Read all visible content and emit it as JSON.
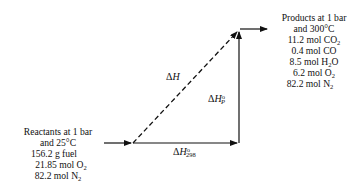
{
  "reactants": {
    "title_line1": "Reactants at 1 bar",
    "title_line2": "and 25°C",
    "fuel": "156.2 g fuel",
    "o2_amount": "21.85 mol O",
    "o2_sub": "2",
    "n2_amount": "82.2 mol N",
    "n2_sub": "2"
  },
  "products": {
    "title_line1": "Products at 1 bar",
    "title_line2": "and 300°C",
    "co2_amount": "11.2 mol CO",
    "co2_sub": "2",
    "co": "0.4 mol CO",
    "h2o_pre": "8.5 mol H",
    "h2o_sub": "2",
    "h2o_post": "O",
    "o2_amount": "6.2 mol O",
    "o2_sub": "2",
    "n2_amount": "82.2 mol N",
    "n2_sub": "2"
  },
  "paths": {
    "delta_h": {
      "delta": "Δ",
      "symbol": "H"
    },
    "delta_hp": {
      "delta": "Δ",
      "symbol": "H",
      "sup": "o",
      "sub": "P"
    },
    "delta_h298": {
      "delta": "Δ",
      "symbol": "H",
      "sup": "o",
      "sub": "298"
    }
  },
  "colors": {
    "line": "#111111",
    "background": "#ffffff"
  }
}
